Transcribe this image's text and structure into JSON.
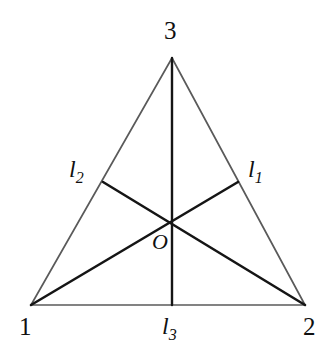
{
  "figure": {
    "background_color": "#ffffff",
    "edge_color": "#5a5a5a",
    "cevian_color": "#151515",
    "label_color": "#101010",
    "vertices": {
      "v1": {
        "label": "1",
        "x": 31,
        "y": 305
      },
      "v2": {
        "label": "2",
        "x": 305,
        "y": 305
      },
      "v3": {
        "label": "3",
        "x": 172,
        "y": 58
      }
    },
    "center_point": {
      "label": "O",
      "x": 172,
      "y": 222
    },
    "midpoints": {
      "m_edge_23": {
        "x": 238,
        "y": 182
      },
      "m_edge_13": {
        "x": 103,
        "y": 182
      },
      "m_edge_12": {
        "x": 172,
        "y": 305
      }
    },
    "lines": [
      {
        "name": "l1",
        "label": "l",
        "subscript": "1",
        "from": "v1",
        "to": "m_edge_23"
      },
      {
        "name": "l2",
        "label": "l",
        "subscript": "2",
        "from": "v2",
        "to": "m_edge_13"
      },
      {
        "name": "l3",
        "label": "l",
        "subscript": "3",
        "from": "v3",
        "to": "m_edge_12"
      }
    ]
  }
}
